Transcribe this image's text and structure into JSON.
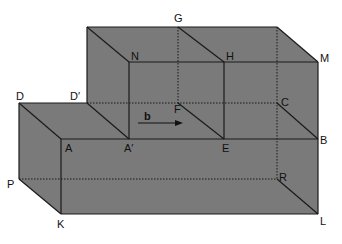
{
  "diagram": {
    "type": "3d-solid-composite-cuboids",
    "colors": {
      "fill": "#7a7a7a",
      "edge": "#1a1a1a",
      "hidden_edge": "#1a1a1a",
      "background": "#ffffff"
    },
    "points": {
      "G": "G",
      "N": "N",
      "H": "H",
      "M": "M",
      "D": "D",
      "D_prime": "D′",
      "F": "F",
      "C": "C",
      "A": "A",
      "A_prime": "A′",
      "E": "E",
      "B": "B",
      "P": "P",
      "R": "R",
      "K": "K",
      "L": "L"
    },
    "vector": {
      "label": "b",
      "direction": "right"
    }
  }
}
